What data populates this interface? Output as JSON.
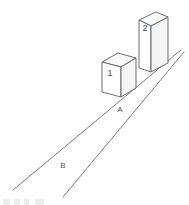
{
  "figure": {
    "background_color": "#ffffff",
    "line_color": "#5d5f63",
    "face_color": "#ffffff",
    "width": 189,
    "height": 205,
    "blocks": [
      {
        "id": "block-1",
        "label": "1",
        "description": "shorter near block",
        "label_x": 110,
        "label_y": 73
      },
      {
        "id": "block-2",
        "label": "2",
        "description": "taller far block",
        "label_x": 145,
        "label_y": 28
      }
    ],
    "road_labels": [
      {
        "id": "label-a",
        "label": "A",
        "x": 120,
        "y": 110,
        "description": "upper road marking near blocks"
      },
      {
        "id": "label-b",
        "label": "B",
        "x": 63,
        "y": 166,
        "description": "lower road marking in foreground"
      }
    ],
    "road": {
      "upper_line": "from (13,190) to (181,50)",
      "lower_line": "from (63,197) to (184,52)"
    },
    "footer_note": ""
  }
}
